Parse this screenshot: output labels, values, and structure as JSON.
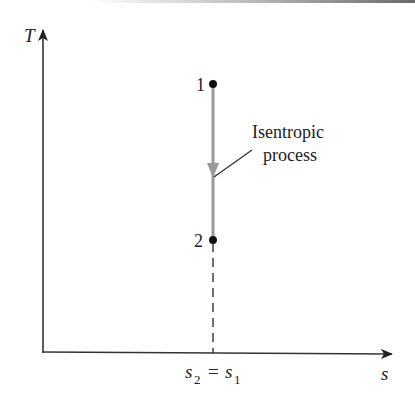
{
  "diagram": {
    "type": "T-s diagram",
    "axes": {
      "y_label": "T",
      "x_label": "s",
      "x_tick_label": {
        "left": "s",
        "left_sub": "2",
        "eq": "=",
        "right": "s",
        "right_sub": "1"
      }
    },
    "points": [
      {
        "id": "1",
        "label": "1"
      },
      {
        "id": "2",
        "label": "2"
      }
    ],
    "process": {
      "label_line1": "Isentropic",
      "label_line2": "process",
      "direction": "1 to 2 (downward)"
    },
    "colors": {
      "axis": "#222222",
      "process_line": "#9a9a9a",
      "points": "#111111",
      "dashed": "#333333"
    }
  }
}
